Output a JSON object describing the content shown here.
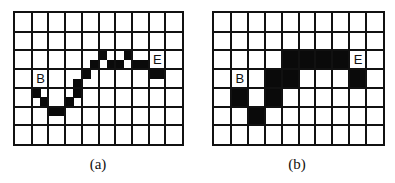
{
  "figure": {
    "panels": [
      {
        "id": "a",
        "caption": "(a)",
        "grid": {
          "cols": 10,
          "rows": 7
        },
        "subdivision": 2,
        "start_label": "B",
        "end_label": "E",
        "start_cell": [
          3,
          1
        ],
        "end_cell": [
          2,
          8
        ],
        "filled_subpixels": [
          [
            8,
            2
          ],
          [
            9,
            3
          ],
          [
            10,
            4
          ],
          [
            10,
            5
          ],
          [
            9,
            6
          ],
          [
            8,
            7
          ],
          [
            7,
            7
          ],
          [
            6,
            8
          ],
          [
            5,
            9
          ],
          [
            4,
            10
          ],
          [
            5,
            11
          ],
          [
            5,
            12
          ],
          [
            4,
            13
          ],
          [
            5,
            14
          ],
          [
            5,
            15
          ],
          [
            6,
            16
          ],
          [
            6,
            17
          ]
        ]
      },
      {
        "id": "b",
        "caption": "(b)",
        "grid": {
          "cols": 10,
          "rows": 7
        },
        "subdivision": 1,
        "start_label": "B",
        "end_label": "E",
        "start_cell": [
          3,
          1
        ],
        "end_cell": [
          2,
          8
        ],
        "filled_cells": [
          [
            2,
            4
          ],
          [
            2,
            5
          ],
          [
            2,
            6
          ],
          [
            2,
            7
          ],
          [
            3,
            3
          ],
          [
            3,
            4
          ],
          [
            3,
            8
          ],
          [
            4,
            1
          ],
          [
            4,
            3
          ],
          [
            5,
            2
          ]
        ]
      }
    ],
    "colors": {
      "fill": "#0a0a0a",
      "grid_line": "#111111",
      "background": "#ffffff"
    }
  }
}
